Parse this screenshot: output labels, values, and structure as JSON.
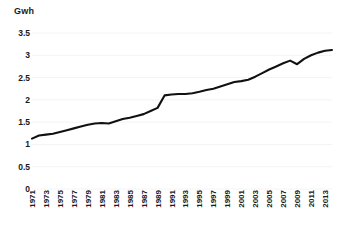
{
  "chart_data": {
    "type": "line",
    "title": "",
    "ylabel": "Gwh",
    "xlabel": "",
    "ylim": [
      0,
      3.5
    ],
    "yticks": [
      0,
      0.5,
      1,
      1.5,
      2,
      2.5,
      3,
      3.5
    ],
    "ytick_labels": [
      "0",
      "0.5",
      "1",
      "1.5",
      "2",
      "2.5",
      "3",
      "3.5"
    ],
    "xlim": [
      1971,
      2014
    ],
    "xtick_labels": [
      "1971",
      "1973",
      "1975",
      "1977",
      "1979",
      "1981",
      "1983",
      "1985",
      "1987",
      "1989",
      "1991",
      "1993",
      "1995",
      "1997",
      "1999",
      "2001",
      "2003",
      "2005",
      "2007",
      "2009",
      "2011",
      "2013"
    ],
    "grid": true,
    "legend": false,
    "line_color": "#111111",
    "x": [
      1971,
      1972,
      1973,
      1974,
      1975,
      1976,
      1977,
      1978,
      1979,
      1980,
      1981,
      1982,
      1983,
      1984,
      1985,
      1986,
      1987,
      1988,
      1989,
      1990,
      1991,
      1992,
      1993,
      1994,
      1995,
      1996,
      1997,
      1998,
      1999,
      2000,
      2001,
      2002,
      2003,
      2004,
      2005,
      2006,
      2007,
      2008,
      2009,
      2010,
      2011,
      2012,
      2013,
      2014
    ],
    "values": [
      1.13,
      1.2,
      1.22,
      1.24,
      1.28,
      1.32,
      1.36,
      1.4,
      1.44,
      1.47,
      1.48,
      1.47,
      1.52,
      1.57,
      1.6,
      1.64,
      1.68,
      1.75,
      1.82,
      2.1,
      2.12,
      2.13,
      2.13,
      2.15,
      2.18,
      2.22,
      2.25,
      2.3,
      2.35,
      2.4,
      2.42,
      2.45,
      2.52,
      2.6,
      2.68,
      2.75,
      2.82,
      2.88,
      2.8,
      2.92,
      3.0,
      3.06,
      3.1,
      3.12
    ]
  }
}
